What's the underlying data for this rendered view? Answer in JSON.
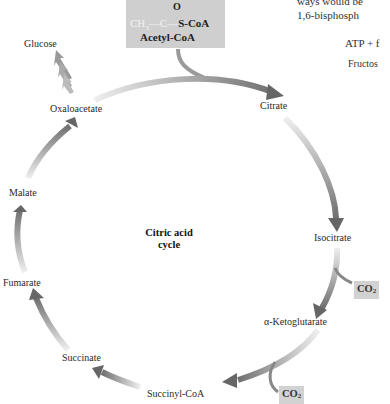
{
  "diagram": {
    "title": "Citric acid cycle",
    "center_label_line1": "Citric acid",
    "center_label_line2": "cycle",
    "input": {
      "formula_top": "O",
      "formula_ch3": "CH",
      "formula_ch3_sub": "3",
      "formula_bond1": "—",
      "formula_c": "C",
      "formula_bond2": "—",
      "formula_scoa": "S-CoA",
      "name": "Acetyl-CoA"
    },
    "intermediates": [
      "Citrate",
      "Isocitrate",
      "α-Ketoglutarate",
      "Succinyl-CoA",
      "Succinate",
      "Fumarate",
      "Malate",
      "Oxaloacetate"
    ],
    "branch_output": "Glucose",
    "co2_outputs": [
      {
        "label": "CO",
        "sub": "2",
        "after": "Isocitrate"
      },
      {
        "label": "CO",
        "sub": "2",
        "after": "α-Ketoglutarate"
      }
    ],
    "colors": {
      "box_fill": "#cfcfcf",
      "arrow_dark": "#6e6e6e",
      "arrow_light": "#e8e8e8"
    }
  },
  "background_text": {
    "line1": "ways would be",
    "line2": "1,6-bisphosph",
    "line3": "ATP + f",
    "line4": "Fructos"
  }
}
